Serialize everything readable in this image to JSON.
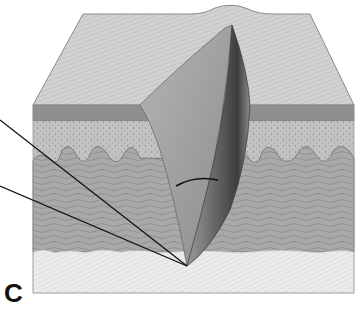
{
  "figure": {
    "type": "anatomical-illustration",
    "panel_label": "C",
    "layers": [
      {
        "name": "surface",
        "color": "#cfcfcf"
      },
      {
        "name": "epidermis",
        "color": "#8f8f8f"
      },
      {
        "name": "papillary-dermis",
        "color": "#bdbdbd"
      },
      {
        "name": "reticular-dermis",
        "color": "#a8a8a8"
      },
      {
        "name": "subcutaneous",
        "color": "#e6e6e6"
      }
    ],
    "pointer_lines": 2
  }
}
